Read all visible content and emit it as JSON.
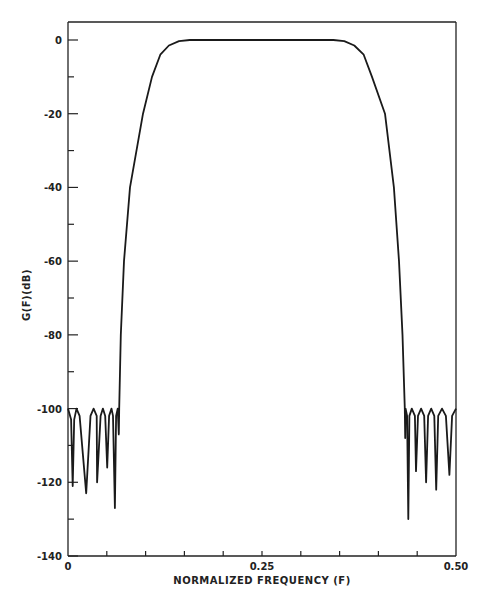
{
  "chart_data": {
    "type": "line",
    "title": "",
    "xlabel": "NORMALIZED FREQUENCY (F)",
    "ylabel": "G(F)(dB)",
    "xlim": [
      0,
      0.5
    ],
    "ylim": [
      -140,
      0
    ],
    "grid": false,
    "legend": null,
    "x_tick_labels": [
      {
        "value": 0,
        "label": "0"
      },
      {
        "value": 0.25,
        "label": "0.25"
      },
      {
        "value": 0.5,
        "label": "0.50"
      }
    ],
    "x_minor_ticks": [
      0.05,
      0.1,
      0.15,
      0.2,
      0.3,
      0.35,
      0.4,
      0.45
    ],
    "y_tick_labels": [
      {
        "value": 0,
        "label": "0"
      },
      {
        "value": -20,
        "label": "-20"
      },
      {
        "value": -40,
        "label": "-40"
      },
      {
        "value": -60,
        "label": "-60"
      },
      {
        "value": -80,
        "label": "-80"
      },
      {
        "value": -100,
        "label": "-100"
      },
      {
        "value": -120,
        "label": "-120"
      },
      {
        "value": -140,
        "label": "-140"
      }
    ],
    "y_minor_ticks": [
      -10,
      -30,
      -50,
      -70,
      -90,
      -110,
      -130
    ],
    "series": [
      {
        "name": "G(F)",
        "points": [
          [
            0.0,
            -100
          ],
          [
            0.004,
            -103
          ],
          [
            0.006,
            -121
          ],
          [
            0.008,
            -103
          ],
          [
            0.011,
            -100
          ],
          [
            0.015,
            -102
          ],
          [
            0.0235,
            -123
          ],
          [
            0.029,
            -102
          ],
          [
            0.033,
            -100
          ],
          [
            0.037,
            -102
          ],
          [
            0.0375,
            -120
          ],
          [
            0.042,
            -102
          ],
          [
            0.045,
            -100
          ],
          [
            0.048,
            -102
          ],
          [
            0.0505,
            -116
          ],
          [
            0.053,
            -102
          ],
          [
            0.056,
            -100
          ],
          [
            0.058,
            -102
          ],
          [
            0.0605,
            -127
          ],
          [
            0.062,
            -102
          ],
          [
            0.064,
            -100
          ],
          [
            0.0655,
            -107
          ],
          [
            0.066,
            -100
          ],
          [
            0.068,
            -80
          ],
          [
            0.0722,
            -60
          ],
          [
            0.0799,
            -40
          ],
          [
            0.0966,
            -20
          ],
          [
            0.1082,
            -10
          ],
          [
            0.119,
            -4
          ],
          [
            0.13,
            -1.5
          ],
          [
            0.143,
            -0.3
          ],
          [
            0.157,
            0
          ],
          [
            0.25,
            0
          ],
          [
            0.342,
            0
          ],
          [
            0.356,
            -0.3
          ],
          [
            0.369,
            -1.5
          ],
          [
            0.381,
            -4
          ],
          [
            0.3918,
            -10
          ],
          [
            0.4085,
            -20
          ],
          [
            0.4085,
            -20
          ],
          [
            0.4085,
            -20
          ],
          [
            0.4085,
            -20
          ],
          [
            0.4085,
            -20
          ],
          [
            0.4085,
            -20
          ],
          [
            0.4085,
            -20
          ],
          [
            0.4085,
            -20
          ],
          [
            0.4085,
            -20
          ],
          [
            0.4085,
            -20
          ],
          [
            0.4085,
            -20
          ],
          [
            0.4085,
            -20
          ]
        ],
        "points_note": "Passband 0 dB approx 0.157–0.342; stopbands at -100 dB with nulls; right side mirrors left",
        "right_side_points": [
          [
            0.4085,
            -20
          ],
          [
            0.42,
            -40
          ],
          [
            0.4265,
            -60
          ],
          [
            0.431,
            -80
          ],
          [
            0.434,
            -100
          ],
          [
            0.4345,
            -108
          ],
          [
            0.435,
            -100
          ],
          [
            0.437,
            -102
          ],
          [
            0.4385,
            -130
          ],
          [
            0.44,
            -102
          ],
          [
            0.443,
            -100
          ],
          [
            0.447,
            -102
          ],
          [
            0.4485,
            -117
          ],
          [
            0.451,
            -102
          ],
          [
            0.455,
            -100
          ],
          [
            0.459,
            -102
          ],
          [
            0.4615,
            -120
          ],
          [
            0.464,
            -102
          ],
          [
            0.468,
            -100
          ],
          [
            0.472,
            -102
          ],
          [
            0.4745,
            -122
          ],
          [
            0.477,
            -102
          ],
          [
            0.482,
            -100
          ],
          [
            0.487,
            -102
          ],
          [
            0.4915,
            -118
          ],
          [
            0.495,
            -102
          ],
          [
            0.5,
            -100
          ]
        ],
        "color": "#1a1a1a"
      }
    ],
    "annotations": []
  },
  "labels": {
    "xlabel": "NORMALIZED FREQUENCY (F)",
    "ylabel": "G(F)(dB)"
  }
}
